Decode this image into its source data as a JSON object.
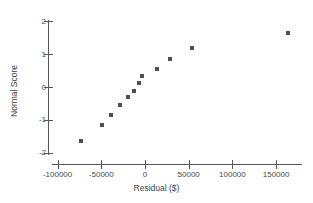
{
  "chart_data": {
    "type": "scatter",
    "title": "",
    "xlabel": "Residual ($)",
    "ylabel": "Normal Score",
    "xlim": [
      -115000,
      180000
    ],
    "ylim": [
      -2.2,
      2.2
    ],
    "grid": false,
    "legend": null,
    "x_ticks": [
      -100000,
      -50000,
      0,
      50000,
      100000,
      150000
    ],
    "x_tick_labels": [
      "-100000",
      "-50000",
      "0",
      "50000",
      "100000",
      "150000"
    ],
    "y_ticks": [
      2,
      1,
      0,
      -1,
      -2
    ],
    "y_tick_labels": [
      "2",
      "1",
      "0",
      "-1",
      "-2"
    ],
    "marker": "square",
    "marker_color": "#4f5052",
    "points": [
      {
        "x": -73000,
        "y": -1.63
      },
      {
        "x": -49000,
        "y": -1.17
      },
      {
        "x": -39000,
        "y": -0.84
      },
      {
        "x": -29000,
        "y": -0.54
      },
      {
        "x": -19000,
        "y": -0.3
      },
      {
        "x": -13000,
        "y": -0.11
      },
      {
        "x": -7000,
        "y": 0.12
      },
      {
        "x": -3000,
        "y": 0.33
      },
      {
        "x": 14000,
        "y": 0.54
      },
      {
        "x": 29000,
        "y": 0.85
      },
      {
        "x": 54000,
        "y": 1.18
      },
      {
        "x": 164000,
        "y": 1.63
      }
    ]
  },
  "axes": {
    "x_title": "Residual ($)",
    "y_title": "Normal Score"
  },
  "colors": {
    "axis": "#58595b",
    "marker": "#4f5052",
    "text": "#3f3f41",
    "background": "#ffffff"
  }
}
